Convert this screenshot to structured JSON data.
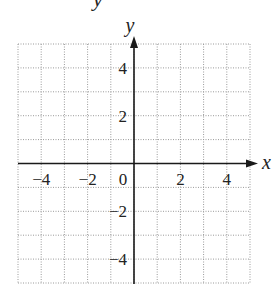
{
  "header": {
    "partial_glyph": "y"
  },
  "chart_data": {
    "type": "scatter",
    "title": "",
    "xlabel": "x",
    "ylabel": "y",
    "xlim": [
      -5,
      5
    ],
    "ylim": [
      -5,
      5
    ],
    "grid": true,
    "grid_style": "dotted",
    "grid_step": 1,
    "x_ticks": [
      -4,
      -2,
      0,
      2,
      4
    ],
    "x_tick_labels": [
      "−4",
      "−2",
      "0",
      "2",
      "4"
    ],
    "y_ticks": [
      4,
      2,
      -2,
      -4
    ],
    "y_tick_labels": [
      "4",
      "2",
      "−2",
      "−4"
    ],
    "series": [],
    "legend": null
  },
  "colors": {
    "axis": "#1a1a1a",
    "grid": "#9a9a9a",
    "text": "#222222"
  }
}
